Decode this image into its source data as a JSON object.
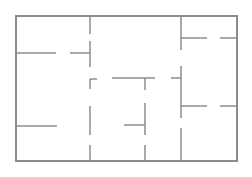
{
  "diagram": {
    "type": "floor-plan",
    "width": 252,
    "height": 177,
    "background": "#ffffff",
    "wall_color": "#8c8c8c",
    "outer_wall_width": 2,
    "inner_wall_width": 1.5,
    "outer": {
      "x1": 16,
      "y1": 16,
      "x2": 237,
      "y2": 161
    },
    "walls": [
      {
        "name": "wall-v-left-upper-1",
        "x1": 90,
        "y1": 16,
        "x2": 90,
        "y2": 34
      },
      {
        "name": "wall-v-left-upper-2",
        "x1": 90,
        "y1": 41,
        "x2": 90,
        "y2": 67
      },
      {
        "name": "wall-v-left-mid-1",
        "x1": 90,
        "y1": 79,
        "x2": 90,
        "y2": 89
      },
      {
        "name": "wall-v-left-mid-2",
        "x1": 90,
        "y1": 106,
        "x2": 90,
        "y2": 135
      },
      {
        "name": "wall-v-left-lower",
        "x1": 90,
        "y1": 145,
        "x2": 90,
        "y2": 161
      },
      {
        "name": "wall-h-left-1",
        "x1": 16,
        "y1": 53,
        "x2": 56,
        "y2": 53
      },
      {
        "name": "wall-h-left-2",
        "x1": 70,
        "y1": 53,
        "x2": 90,
        "y2": 53
      },
      {
        "name": "wall-h-left-lower",
        "x1": 16,
        "y1": 126,
        "x2": 57,
        "y2": 126
      },
      {
        "name": "wall-h-center-corner",
        "x1": 90,
        "y1": 79,
        "x2": 97,
        "y2": 79
      },
      {
        "name": "wall-h-center-top",
        "x1": 112,
        "y1": 78,
        "x2": 155,
        "y2": 78
      },
      {
        "name": "wall-v-center-1",
        "x1": 145,
        "y1": 78,
        "x2": 145,
        "y2": 90
      },
      {
        "name": "wall-v-center-2",
        "x1": 145,
        "y1": 103,
        "x2": 145,
        "y2": 135
      },
      {
        "name": "wall-v-center-3",
        "x1": 145,
        "y1": 145,
        "x2": 145,
        "y2": 161
      },
      {
        "name": "wall-h-center-stub",
        "x1": 124,
        "y1": 125,
        "x2": 145,
        "y2": 125
      },
      {
        "name": "wall-v-right-1",
        "x1": 181,
        "y1": 16,
        "x2": 181,
        "y2": 50
      },
      {
        "name": "wall-v-right-2",
        "x1": 181,
        "y1": 66,
        "x2": 181,
        "y2": 118
      },
      {
        "name": "wall-v-right-3",
        "x1": 181,
        "y1": 128,
        "x2": 181,
        "y2": 161
      },
      {
        "name": "wall-h-right-stub",
        "x1": 171,
        "y1": 78,
        "x2": 181,
        "y2": 78
      },
      {
        "name": "wall-h-right-top-1",
        "x1": 181,
        "y1": 38,
        "x2": 207,
        "y2": 38
      },
      {
        "name": "wall-h-right-top-2",
        "x1": 220,
        "y1": 38,
        "x2": 237,
        "y2": 38
      },
      {
        "name": "wall-h-right-mid-1",
        "x1": 181,
        "y1": 106,
        "x2": 207,
        "y2": 106
      },
      {
        "name": "wall-h-right-mid-2",
        "x1": 220,
        "y1": 106,
        "x2": 237,
        "y2": 106
      }
    ]
  }
}
